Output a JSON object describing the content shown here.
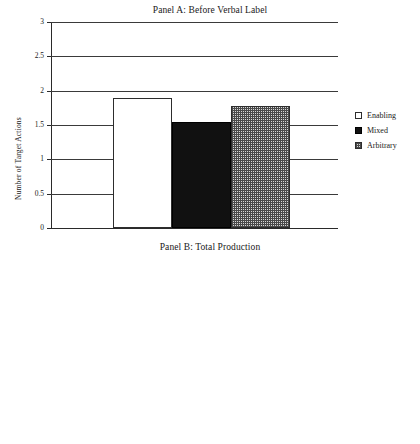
{
  "chart_data": [
    {
      "type": "bar",
      "panel": "A",
      "title": "Panel A: Before Verbal Label",
      "xlabel": "",
      "ylabel": "Number of Target Actions",
      "ylim": [
        0,
        3
      ],
      "yticks": [
        "0",
        "0.5",
        "1",
        "1.5",
        "2",
        "2.5",
        "3"
      ],
      "ytick_values": [
        0,
        0.5,
        1,
        1.5,
        2,
        2.5,
        3
      ],
      "grid": true,
      "legend_position": "right",
      "categories": [
        "Enabling",
        "Mixed",
        "Arbitrary"
      ],
      "values": [
        1.89,
        1.54,
        1.77
      ],
      "series": [
        {
          "name": "Enabling",
          "value": 1.89,
          "fill": "white"
        },
        {
          "name": "Mixed",
          "value": 1.54,
          "fill": "black"
        },
        {
          "name": "Arbitrary",
          "value": 1.77,
          "fill": "crosshatch"
        }
      ]
    },
    {
      "type": "bar",
      "panel": "B",
      "title": "Panel B: Total Production",
      "xlabel": "",
      "ylabel": "Number of Target Actions",
      "ylim": [
        0,
        3
      ],
      "yticks": [
        "0",
        "0.5",
        "1",
        "1.5",
        "2",
        "2.5",
        "3"
      ],
      "ytick_values": [
        0,
        0.5,
        1,
        1.5,
        2,
        2.5,
        3
      ],
      "grid": true,
      "legend_position": "right",
      "categories": [
        "1 Month",
        "3 Month",
        "6 Month"
      ],
      "series": [
        {
          "name": "Enabling",
          "values": [
            2.65,
            1.95,
            2.02
          ],
          "fill": "white"
        },
        {
          "name": "Mixed",
          "values": [
            2.27,
            1.82,
            1.53
          ],
          "fill": "black"
        },
        {
          "name": "Arbitrary",
          "values": [
            2.65,
            2.11,
            1.28
          ],
          "fill": "crosshatch"
        }
      ]
    }
  ],
  "legend": {
    "items": [
      {
        "label": "Enabling",
        "fill": "white"
      },
      {
        "label": "Mixed",
        "fill": "black"
      },
      {
        "label": "Arbitrary",
        "fill": "crosshatch"
      }
    ]
  },
  "colors": {
    "axis": "#2a2a2a",
    "grid": "#3a3a3a",
    "enabling": "#ffffff",
    "mixed": "#111111",
    "arbitrary": "#d8d8d8",
    "text": "#1a1a1a"
  }
}
